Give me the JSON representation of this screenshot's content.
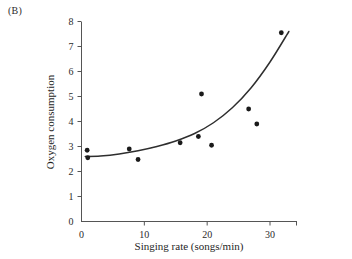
{
  "panel": {
    "label": "(B)"
  },
  "chart_data": {
    "type": "scatter",
    "title": "",
    "xlabel": "Singing rate (songs/min)",
    "ylabel": "Oxygen consumption",
    "xlim": [
      0,
      35
    ],
    "ylim": [
      0,
      8
    ],
    "xticks": [
      0,
      10,
      20,
      30
    ],
    "xtick_labels": [
      "0",
      "10",
      "20",
      "30"
    ],
    "yticks": [
      0,
      1,
      2,
      3,
      4,
      5,
      6,
      7,
      8
    ],
    "ytick_labels": [
      "0",
      "1",
      "2",
      "3",
      "4",
      "5",
      "6",
      "7",
      "8"
    ],
    "grid": false,
    "legend": false,
    "points": [
      {
        "x": 0.9,
        "y": 2.85
      },
      {
        "x": 1.0,
        "y": 2.55
      },
      {
        "x": 7.6,
        "y": 2.9
      },
      {
        "x": 9.0,
        "y": 2.48
      },
      {
        "x": 15.7,
        "y": 3.15
      },
      {
        "x": 18.6,
        "y": 3.4
      },
      {
        "x": 19.1,
        "y": 5.1
      },
      {
        "x": 20.7,
        "y": 3.05
      },
      {
        "x": 26.6,
        "y": 4.5
      },
      {
        "x": 27.9,
        "y": 3.9
      },
      {
        "x": 31.8,
        "y": 7.55
      }
    ],
    "fit": {
      "kind": "exponential",
      "description": "Fitted exponential curve rising from about 2.6 at low singing rates to about 7.6 at a singing rate of 33 songs/min",
      "x_start": 0.6,
      "x_end": 33.0,
      "y_start": 2.6,
      "y_end": 7.6,
      "samples": [
        {
          "x": 0.6,
          "y": 2.6
        },
        {
          "x": 3.0,
          "y": 2.62
        },
        {
          "x": 6.0,
          "y": 2.7
        },
        {
          "x": 9.0,
          "y": 2.83
        },
        {
          "x": 12.0,
          "y": 3.0
        },
        {
          "x": 15.0,
          "y": 3.22
        },
        {
          "x": 18.0,
          "y": 3.52
        },
        {
          "x": 21.0,
          "y": 3.95
        },
        {
          "x": 24.0,
          "y": 4.55
        },
        {
          "x": 27.0,
          "y": 5.35
        },
        {
          "x": 30.0,
          "y": 6.38
        },
        {
          "x": 33.0,
          "y": 7.6
        }
      ]
    }
  }
}
